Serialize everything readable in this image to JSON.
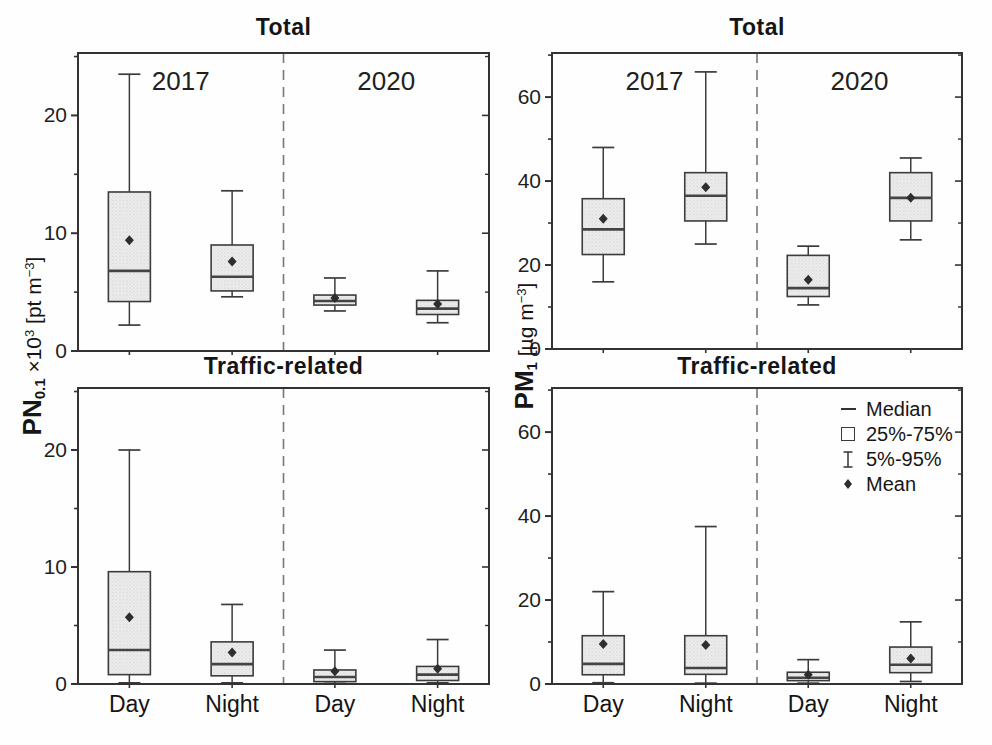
{
  "colors": {
    "axis": "#333333",
    "box_stroke": "#3c3c3c",
    "box_fill_base": "#ededed",
    "box_fill_dot": "#b9b9b9",
    "median": "#444444",
    "mean": "#2e2e2e",
    "divider": "#777777",
    "text": "#1f1f1f"
  },
  "y_axis_left": {
    "prefix": "PN",
    "prefix_sub": "0.1",
    "mid": " ×10",
    "mid_sup": "3",
    "unit": " [pt m",
    "unit_sup": "−3",
    "suffix": "]"
  },
  "y_axis_right": {
    "prefix": "PM",
    "prefix_sub": "1",
    "mid": "",
    "mid_sup": "",
    "unit": " [µg m",
    "unit_sup": "−3",
    "suffix": "]"
  },
  "legend": {
    "items": [
      {
        "symbol": "median-line",
        "label": "Median"
      },
      {
        "symbol": "box-outline",
        "label": "25%-75%"
      },
      {
        "symbol": "whisker",
        "label": "5%-95%"
      },
      {
        "symbol": "mean-diamond",
        "label": "Mean"
      }
    ]
  },
  "chart_data": [
    {
      "type": "box",
      "position": "top-left",
      "title": "Total",
      "ylabel": "PN0.1 ×10^3 [pt m^-3]",
      "ylim": [
        0,
        25.3
      ],
      "yticks": [
        0,
        10,
        20
      ],
      "yticks_minor": [
        5,
        15,
        25
      ],
      "group_labels": [
        "2017",
        "2020"
      ],
      "categories": [
        "Day",
        "Night",
        "Day",
        "Night"
      ],
      "x_tick_labels": [],
      "boxes": [
        {
          "group": "2017",
          "category": "Day",
          "p5": 2.2,
          "q1": 4.2,
          "median": 6.8,
          "q3": 13.5,
          "p95": 23.5,
          "mean": 9.4
        },
        {
          "group": "2017",
          "category": "Night",
          "p5": 4.6,
          "q1": 5.1,
          "median": 6.3,
          "q3": 9.0,
          "p95": 13.6,
          "mean": 7.6
        },
        {
          "group": "2020",
          "category": "Day",
          "p5": 3.4,
          "q1": 3.9,
          "median": 4.25,
          "q3": 4.75,
          "p95": 6.2,
          "mean": 4.5
        },
        {
          "group": "2020",
          "category": "Night",
          "p5": 2.4,
          "q1": 3.1,
          "median": 3.6,
          "q3": 4.3,
          "p95": 6.8,
          "mean": 4.0
        }
      ]
    },
    {
      "type": "box",
      "position": "top-right",
      "title": "Total",
      "ylabel": "PM1 [µg m^-3]",
      "ylim": [
        0,
        70.5
      ],
      "yticks": [
        0,
        20,
        40,
        60
      ],
      "yticks_minor": [
        10,
        30,
        50,
        70
      ],
      "group_labels": [
        "2017",
        "2020"
      ],
      "categories": [
        "Day",
        "Night",
        "Day",
        "Night"
      ],
      "x_tick_labels": [],
      "boxes": [
        {
          "group": "2017",
          "category": "Day",
          "p5": 16.0,
          "q1": 22.5,
          "median": 28.5,
          "q3": 35.8,
          "p95": 48.0,
          "mean": 31.0
        },
        {
          "group": "2017",
          "category": "Night",
          "p5": 25.0,
          "q1": 30.5,
          "median": 36.5,
          "q3": 42.0,
          "p95": 66.0,
          "mean": 38.5
        },
        {
          "group": "2020",
          "category": "Day",
          "p5": 10.5,
          "q1": 12.5,
          "median": 14.5,
          "q3": 22.3,
          "p95": 24.5,
          "mean": 16.5
        },
        {
          "group": "2020",
          "category": "Night",
          "p5": 26.0,
          "q1": 30.5,
          "median": 36.0,
          "q3": 42.0,
          "p95": 45.5,
          "mean": 36.0
        }
      ]
    },
    {
      "type": "box",
      "position": "bottom-left",
      "title": "Traffic-related",
      "ylabel": "PN0.1 ×10^3 [pt m^-3]",
      "ylim": [
        0,
        25.3
      ],
      "yticks": [
        0,
        10,
        20
      ],
      "yticks_minor": [
        5,
        15,
        25
      ],
      "group_labels": [],
      "categories": [
        "Day",
        "Night",
        "Day",
        "Night"
      ],
      "x_tick_labels": [
        "Day",
        "Night",
        "Day",
        "Night"
      ],
      "boxes": [
        {
          "group": "2017",
          "category": "Day",
          "p5": 0.1,
          "q1": 0.8,
          "median": 2.9,
          "q3": 9.6,
          "p95": 20.0,
          "mean": 5.7
        },
        {
          "group": "2017",
          "category": "Night",
          "p5": 0.1,
          "q1": 0.7,
          "median": 1.7,
          "q3": 3.6,
          "p95": 6.8,
          "mean": 2.7
        },
        {
          "group": "2020",
          "category": "Day",
          "p5": 0.05,
          "q1": 0.2,
          "median": 0.6,
          "q3": 1.2,
          "p95": 2.9,
          "mean": 1.1
        },
        {
          "group": "2020",
          "category": "Night",
          "p5": 0.1,
          "q1": 0.3,
          "median": 0.8,
          "q3": 1.5,
          "p95": 3.8,
          "mean": 1.3
        }
      ]
    },
    {
      "type": "box",
      "position": "bottom-right",
      "title": "Traffic-related",
      "ylabel": "PM1 [µg m^-3]",
      "ylim": [
        0,
        70.5
      ],
      "yticks": [
        0,
        20,
        40,
        60
      ],
      "yticks_minor": [
        10,
        30,
        50,
        70
      ],
      "group_labels": [],
      "categories": [
        "Day",
        "Night",
        "Day",
        "Night"
      ],
      "x_tick_labels": [
        "Day",
        "Night",
        "Day",
        "Night"
      ],
      "boxes": [
        {
          "group": "2017",
          "category": "Day",
          "p5": 0.3,
          "q1": 2.2,
          "median": 4.8,
          "q3": 11.5,
          "p95": 22.0,
          "mean": 9.5
        },
        {
          "group": "2017",
          "category": "Night",
          "p5": 0.2,
          "q1": 2.3,
          "median": 3.8,
          "q3": 11.5,
          "p95": 37.5,
          "mean": 9.3
        },
        {
          "group": "2020",
          "category": "Day",
          "p5": 0.2,
          "q1": 0.8,
          "median": 1.5,
          "q3": 2.8,
          "p95": 5.8,
          "mean": 2.2
        },
        {
          "group": "2020",
          "category": "Night",
          "p5": 0.6,
          "q1": 2.7,
          "median": 4.6,
          "q3": 8.8,
          "p95": 14.8,
          "mean": 6.1
        }
      ]
    }
  ]
}
